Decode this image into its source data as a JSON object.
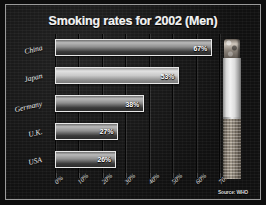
{
  "chart_data": {
    "type": "bar",
    "orientation": "horizontal",
    "title": "Smoking rates for 2002 (Men)",
    "categories": [
      "China",
      "Japan",
      "Germany",
      "U.K.",
      "USA"
    ],
    "values": [
      67,
      53,
      38,
      27,
      26
    ],
    "value_labels": [
      "67%",
      "53%",
      "38%",
      "27%",
      "26%"
    ],
    "xlabel": "",
    "ylabel": "",
    "xlim": [
      0,
      70
    ],
    "xticks": [
      0,
      10,
      20,
      30,
      40,
      50,
      60,
      70
    ],
    "xtick_labels": [
      "0%",
      "10%",
      "20%",
      "30%",
      "40%",
      "50%",
      "60%",
      "70%"
    ],
    "grid": true,
    "legend": false,
    "highlight_category": "Japan",
    "annotation": "Source: WHO"
  },
  "figure": {
    "source_caption": "Source: WHO",
    "cigarette_alt": "cigarette-photo"
  },
  "colors": {
    "background": "#141414",
    "border": "#9a9a9a",
    "text": "#f2f2f2",
    "bar_outline": "#e8e8e8",
    "gridline": "#050505"
  }
}
